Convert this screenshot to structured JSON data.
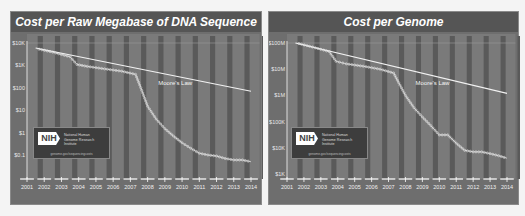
{
  "chart_data": [
    {
      "type": "line",
      "title": "Cost per Raw Megabase of DNA Sequence",
      "xlabel": "",
      "ylabel": "",
      "y_scale": "log",
      "y_ticks": [
        "$10K",
        "$1K",
        "$100",
        "$10",
        "$1",
        "$0.1"
      ],
      "y_tick_values": [
        10000,
        1000,
        100,
        10,
        1,
        0.1
      ],
      "x_ticks": [
        "2001",
        "2002",
        "2003",
        "2004",
        "2005",
        "2006",
        "2007",
        "2008",
        "2009",
        "2010",
        "2011",
        "2012",
        "2013",
        "2014"
      ],
      "grid": "alternating vertical bands",
      "series": [
        {
          "name": "Cost per Raw Megabase",
          "x": [
            2001.7,
            2002.5,
            2003.5,
            2003.9,
            2004.5,
            2005.5,
            2006.5,
            2007.3,
            2007.6,
            2008.0,
            2008.5,
            2009.0,
            2009.5,
            2010.0,
            2010.5,
            2011.0,
            2011.5,
            2012.0,
            2012.5,
            2013.0,
            2013.5,
            2014.0
          ],
          "values": [
            5292,
            3898,
            2413,
            1100,
            900,
            700,
            550,
            397,
            102,
            15,
            4,
            1.5,
            0.7,
            0.35,
            0.2,
            0.12,
            0.1,
            0.09,
            0.07,
            0.06,
            0.06,
            0.05
          ]
        },
        {
          "name": "Moore's Law",
          "x": [
            2001.5,
            2014
          ],
          "values": [
            6000,
            70
          ]
        }
      ],
      "annotations": [
        "Moore's Law"
      ],
      "logo": {
        "name": "NIH",
        "org": "National Human Genome Research Institute",
        "url": "genome.gov/sequencingcosts"
      }
    },
    {
      "type": "line",
      "title": "Cost per Genome",
      "xlabel": "",
      "ylabel": "",
      "y_scale": "log",
      "y_ticks": [
        "$100M",
        "$10M",
        "$1M",
        "$100K",
        "$10K",
        "$1K"
      ],
      "y_tick_values": [
        100000000,
        10000000,
        1000000,
        100000,
        10000,
        1000
      ],
      "x_ticks": [
        "2001",
        "2002",
        "2003",
        "2004",
        "2005",
        "2006",
        "2007",
        "2008",
        "2009",
        "2010",
        "2011",
        "2012",
        "2013",
        "2014"
      ],
      "grid": "alternating vertical bands",
      "series": [
        {
          "name": "Cost per Genome",
          "x": [
            2001.7,
            2002.5,
            2003.5,
            2003.9,
            2004.5,
            2005.5,
            2006.5,
            2007.3,
            2007.6,
            2008.0,
            2008.5,
            2009.0,
            2009.5,
            2010.0,
            2010.5,
            2011.0,
            2011.5,
            2012.0,
            2012.5,
            2013.0,
            2013.5,
            2014.0
          ],
          "values": [
            95263072,
            70175437,
            46774465,
            20000000,
            16000000,
            13000000,
            10000000,
            7147571,
            3063820,
            1000000,
            340000,
            150000,
            70000,
            31000,
            31000,
            15000,
            8000,
            7000,
            7000,
            6000,
            5000,
            4000
          ]
        },
        {
          "name": "Moore's Law",
          "x": [
            2001.5,
            2014
          ],
          "values": [
            100000000,
            1200000
          ]
        }
      ],
      "annotations": [
        "Moore's Law"
      ],
      "logo": {
        "name": "NIH",
        "org": "National Human Genome Research Institute",
        "url": "genome.gov/sequencingcosts"
      }
    }
  ],
  "panels": {
    "left": {
      "title": "Cost per Raw Megabase of DNA Sequence",
      "moore_label": "Moore's Law"
    },
    "right": {
      "title": "Cost per Genome",
      "moore_label": "Moore's Law"
    }
  },
  "logo": {
    "abbr": "NIH",
    "org": "National Human Genome Research Institute",
    "url": "genome.gov/sequencingcosts"
  },
  "colors": {
    "panel_bg": "#6e6e6e",
    "title_bg": "#555555",
    "band_dark": "#5a5a5a",
    "band_light": "#7a7a7a",
    "line": "#f2f2f2"
  }
}
